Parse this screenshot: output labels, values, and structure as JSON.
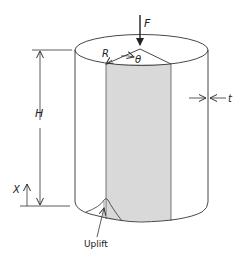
{
  "diagram": {
    "type": "cylindrical shell under axial load",
    "labels": {
      "force": "F",
      "radius": "R",
      "angle": "θ",
      "height": "H",
      "thickness": "t",
      "axial_coord": "X",
      "uplift": "Uplift"
    },
    "colors": {
      "line": "#333333",
      "shaded_panel": "#d9d9d9",
      "background": "#ffffff"
    }
  }
}
